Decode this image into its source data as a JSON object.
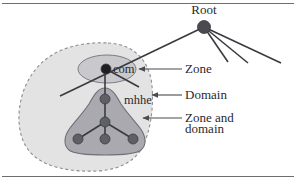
{
  "figure": {
    "kind": "dns-zone-domain-diagram",
    "background_color": "#ffffff",
    "frame_color": "#6e6e72"
  },
  "palette": {
    "node_fill": "#5f5f66",
    "root_node_fill": "#4a4a50",
    "com_node_fill": "#1f1f23",
    "edge_color": "#3a3a40",
    "domain_fill": "#e3e3e3",
    "domain_stroke": "#8d8d94",
    "zone_ellipse_fill": "#c9c9cd",
    "zone_ellipse_stroke": "#7b7b82",
    "zone_domain_fill": "#a9a9af",
    "zone_domain_stroke": "#6f6f76",
    "leader_line_color": "#4a4a50",
    "text_color": "#2a2a2e"
  },
  "nodes": [
    {
      "id": "root",
      "label": "Root",
      "x": 204,
      "y": 27,
      "r": 6.5,
      "label_x": 204,
      "label_y": 14,
      "label_anchor": "middle"
    },
    {
      "id": "com",
      "label": "com",
      "x": 106,
      "y": 69,
      "r": 5.0,
      "label_x": 113,
      "label_y": 73,
      "label_anchor": "start"
    },
    {
      "id": "mhhe",
      "label": "mhhe",
      "x": 105,
      "y": 99,
      "r": 5.0,
      "label_x": 124,
      "label_y": 104,
      "label_anchor": "start"
    },
    {
      "id": "mid",
      "label": "",
      "x": 105,
      "y": 122,
      "r": 5.0,
      "label_x": 0,
      "label_y": 0,
      "label_anchor": "start"
    },
    {
      "id": "leaf-left",
      "label": "",
      "x": 78,
      "y": 139,
      "r": 5.0,
      "label_x": 0,
      "label_y": 0,
      "label_anchor": "start"
    },
    {
      "id": "leaf-center",
      "label": "",
      "x": 105,
      "y": 139,
      "r": 5.0,
      "label_x": 0,
      "label_y": 0,
      "label_anchor": "start"
    },
    {
      "id": "leaf-right",
      "label": "",
      "x": 133,
      "y": 139,
      "r": 5.0,
      "label_x": 0,
      "label_y": 0,
      "label_anchor": "start"
    }
  ],
  "tree_edges": [
    {
      "name": "root-to-com",
      "x1": 204,
      "y1": 27,
      "x2": 60,
      "y2": 96
    },
    {
      "name": "root-branch-1",
      "x1": 204,
      "y1": 27,
      "x2": 228,
      "y2": 62
    },
    {
      "name": "root-branch-2",
      "x1": 204,
      "y1": 27,
      "x2": 248,
      "y2": 63
    },
    {
      "name": "root-branch-3",
      "x1": 204,
      "y1": 27,
      "x2": 281,
      "y2": 63
    },
    {
      "name": "com-branch-right",
      "x1": 106,
      "y1": 69,
      "x2": 139,
      "y2": 87
    },
    {
      "name": "com-to-mhhe",
      "x1": 105,
      "y1": 69,
      "x2": 105,
      "y2": 99
    },
    {
      "name": "mhhe-to-mid",
      "x1": 105,
      "y1": 99,
      "x2": 105,
      "y2": 122
    },
    {
      "name": "mid-to-leaf-left",
      "x1": 105,
      "y1": 122,
      "x2": 78,
      "y2": 139
    },
    {
      "name": "mid-to-leaf-center",
      "x1": 105,
      "y1": 122,
      "x2": 105,
      "y2": 139
    },
    {
      "name": "mid-to-leaf-right",
      "x1": 105,
      "y1": 122,
      "x2": 133,
      "y2": 139
    }
  ],
  "regions": {
    "domain_blob": {
      "name": "domain-region",
      "path": "M 108 43 C 135 44, 150 62, 152 86 C 154 110, 150 132, 142 148 C 134 162, 118 170, 97 171 C 72 172, 48 168, 34 156 C 20 144, 17 124, 20 105 C 23 85, 34 66, 52 55 C 68 45, 90 42, 108 43 Z"
    },
    "zone_ellipse": {
      "name": "zone-region",
      "cx": 107,
      "cy": 69,
      "rx": 29,
      "ry": 14
    },
    "zone_and_domain_blob": {
      "name": "zone-and-domain-region",
      "path": "M 105 88 C 112 88, 116 95, 121 104 C 127 113, 134 120, 140 128 C 146 136, 147 145, 141 150 C 136 154, 125 155, 105 155 C 85 155, 74 154, 69 150 C 63 145, 64 136, 70 128 C 76 120, 83 113, 89 104 C 94 95, 98 88, 105 88 Z"
    }
  },
  "callouts": [
    {
      "id": "zone",
      "label": "Zone",
      "label_x": 185,
      "label_y": 73,
      "line_x1": 182,
      "line_y1": 69,
      "line_x2": 142,
      "line_y2": 69,
      "arrow_x": 139,
      "arrow_y": 69
    },
    {
      "id": "domain",
      "label": "Domain",
      "label_x": 185,
      "label_y": 99,
      "line_x1": 182,
      "line_y1": 95,
      "line_x2": 155,
      "line_y2": 95,
      "arrow_x": 152,
      "arrow_y": 95
    },
    {
      "id": "zone-and-domain",
      "label_line_1": "Zone and",
      "label_line_2": "domain",
      "label_x": 185,
      "label_y": 122,
      "label_y2": 133,
      "line_x1": 182,
      "line_y1": 118,
      "line_x2": 146,
      "line_y2": 118,
      "arrow_x": 143,
      "arrow_y": 118
    }
  ]
}
